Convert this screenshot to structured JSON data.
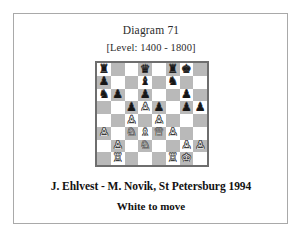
{
  "diagram": {
    "title": "Diagram 71",
    "level": "[Level: 1400 - 1800]",
    "caption": "J. Ehlvest - M. Novik, St Petersburg 1994",
    "subcaption": "White to move"
  },
  "colors": {
    "light_square": "#ffffff",
    "dark_square": "#b9b9b9",
    "board_border": "#6e6e6e",
    "card_border": "#a9a9a9",
    "page_background": "#ffffff",
    "white_piece": "#f7f7f7",
    "black_piece": "#161616"
  },
  "board": {
    "files": [
      "a",
      "b",
      "c",
      "d",
      "e",
      "f",
      "g",
      "h"
    ],
    "ranks": [
      8,
      7,
      6,
      5,
      4,
      3,
      2,
      1
    ],
    "orientation": "white-bottom",
    "side_to_move": "white",
    "fen": "r2q1rk1/p2b1n2/np1p2p1/2pPp1pp/2P1P3/P1NBQP2/1P1N2PP/1R3RK1 w - -",
    "glyphs": {
      "K": "♔",
      "Q": "♕",
      "R": "♖",
      "B": "♗",
      "N": "♘",
      "P": "♙",
      "k": "♚",
      "q": "♛",
      "r": "♜",
      "b": "♝",
      "n": "♞",
      "p": "♟"
    },
    "piece_names": {
      "K": "white-king",
      "Q": "white-queen",
      "R": "white-rook",
      "B": "white-bishop",
      "N": "white-knight",
      "P": "white-pawn",
      "k": "black-king",
      "q": "black-queen",
      "r": "black-rook",
      "b": "black-bishop",
      "n": "black-knight",
      "p": "black-pawn"
    },
    "rows": [
      [
        "r",
        "",
        "",
        "q",
        "",
        "r",
        "k",
        ""
      ],
      [
        "p",
        "",
        "",
        "b",
        "",
        "n",
        "",
        ""
      ],
      [
        "n",
        "p",
        "",
        "p",
        "",
        "",
        "p",
        ""
      ],
      [
        "",
        "",
        "p",
        "P",
        "p",
        "",
        "p",
        "p"
      ],
      [
        "",
        "",
        "P",
        "",
        "P",
        "",
        "",
        ""
      ],
      [
        "P",
        "",
        "N",
        "B",
        "Q",
        "P",
        "",
        ""
      ],
      [
        "",
        "P",
        "",
        "N",
        "",
        "",
        "P",
        "P"
      ],
      [
        "",
        "R",
        "",
        "",
        "",
        "R",
        "K",
        ""
      ]
    ]
  }
}
